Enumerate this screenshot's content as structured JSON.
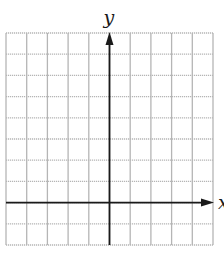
{
  "diagram": {
    "type": "coordinate-grid",
    "x_axis_label": "x",
    "y_axis_label": "y",
    "grid": {
      "columns": 10,
      "rows": 10,
      "left": 6,
      "top": 33,
      "right": 213,
      "bottom": 245,
      "line_color": "#b5b5b5",
      "border_style": "dotted"
    },
    "axes": {
      "y_axis_column": 5,
      "x_axis_row_from_top": 8,
      "color": "#1a1a1a",
      "arrows": [
        "y-positive",
        "x-positive"
      ]
    }
  }
}
